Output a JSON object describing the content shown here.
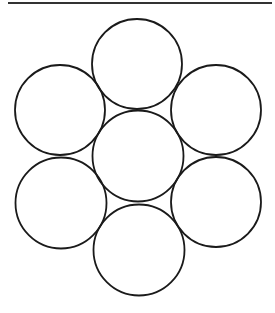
{
  "diagram": {
    "type": "hexagonal-circle-packing",
    "circle_count": 7,
    "stroke_color": "#1a1a1a",
    "background": "#ffffff",
    "top_rule": {
      "x1": 8,
      "x2": 272,
      "y": 3,
      "color": "#333333"
    },
    "circles": [
      {
        "name": "top",
        "cx": 137,
        "cy": 64,
        "r": 45
      },
      {
        "name": "upper-left",
        "cx": 60,
        "cy": 110,
        "r": 45
      },
      {
        "name": "upper-right",
        "cx": 216,
        "cy": 110,
        "r": 45
      },
      {
        "name": "center",
        "cx": 138,
        "cy": 156,
        "r": 45.5
      },
      {
        "name": "lower-left",
        "cx": 61,
        "cy": 203,
        "r": 45.5
      },
      {
        "name": "lower-right",
        "cx": 216,
        "cy": 202,
        "r": 45
      },
      {
        "name": "bottom",
        "cx": 139,
        "cy": 250,
        "r": 45.5
      }
    ]
  }
}
